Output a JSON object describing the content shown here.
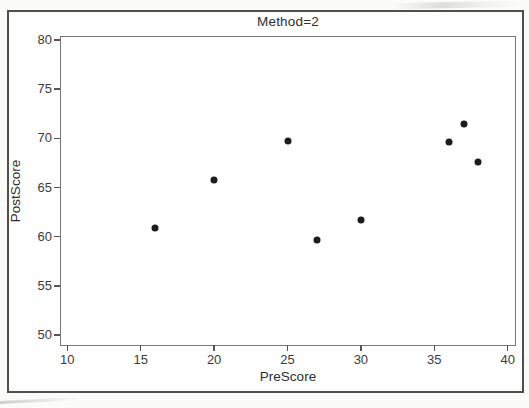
{
  "figure": {
    "title": "Method=2",
    "x_axis_title": "PreScore",
    "y_axis_title": "PostScore"
  },
  "colors": {
    "marker": "#1c1c1c",
    "text": "#3b3b3b",
    "outer_border": "#4f4f4f",
    "plot_border": "#787878",
    "background": "#fefefe"
  },
  "chart_data": {
    "type": "scatter",
    "title": "Method=2",
    "xlabel": "PreScore",
    "ylabel": "PostScore",
    "xlim": [
      9.5,
      40.5
    ],
    "ylim": [
      49.0,
      80.4
    ],
    "xticks": [
      10,
      15,
      20,
      25,
      30,
      35,
      40
    ],
    "yticks": [
      50,
      55,
      60,
      65,
      70,
      75,
      80
    ],
    "grid": false,
    "legend": "none",
    "marker": {
      "shape": "circle",
      "size_px": 7,
      "color": "#1c1c1c"
    },
    "points": [
      {
        "x": 16,
        "y": 60.9
      },
      {
        "x": 20,
        "y": 65.8
      },
      {
        "x": 25,
        "y": 69.7
      },
      {
        "x": 27,
        "y": 59.7
      },
      {
        "x": 30,
        "y": 61.7
      },
      {
        "x": 36,
        "y": 69.6
      },
      {
        "x": 37,
        "y": 71.5
      },
      {
        "x": 38,
        "y": 67.6
      }
    ]
  }
}
